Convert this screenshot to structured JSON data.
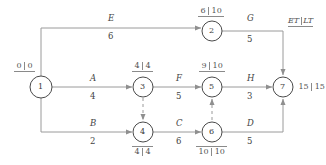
{
  "diagram": {
    "legend": {
      "et": "ET",
      "lt": "LT",
      "separator": "|"
    },
    "colors": {
      "line": "#9a9a9a",
      "node_stroke": "#4a4a4a",
      "text": "#3a3a3a",
      "rule": "#8a8a8a"
    },
    "nodes": [
      {
        "id": "1",
        "label": "1",
        "x": 41,
        "y": 87,
        "r": 11,
        "et": "0",
        "lt": "0",
        "times_pos": "above-left"
      },
      {
        "id": "2",
        "label": "2",
        "x": 212,
        "y": 31,
        "r": 10,
        "et": "6",
        "lt": "10",
        "times_pos": "above"
      },
      {
        "id": "3",
        "label": "3",
        "x": 143,
        "y": 87,
        "r": 10,
        "et": "4",
        "lt": "4",
        "times_pos": "above"
      },
      {
        "id": "4",
        "label": "4",
        "x": 143,
        "y": 132,
        "r": 10,
        "et": "4",
        "lt": "4",
        "times_pos": "below"
      },
      {
        "id": "5",
        "label": "5",
        "x": 212,
        "y": 87,
        "r": 10,
        "et": "9",
        "lt": "10",
        "times_pos": "above"
      },
      {
        "id": "6",
        "label": "6",
        "x": 212,
        "y": 132,
        "r": 10,
        "et": "10",
        "lt": "10",
        "times_pos": "below"
      },
      {
        "id": "7",
        "label": "7",
        "x": 283,
        "y": 87,
        "r": 10,
        "et": "15",
        "lt": "15",
        "times_pos": "right"
      }
    ],
    "activities": [
      {
        "name": "E",
        "duration": "6",
        "from": "1",
        "to": "2",
        "label_x": 110,
        "label_y": 20
      },
      {
        "name": "G",
        "duration": "5",
        "from": "2",
        "to": "7",
        "label_x": 248,
        "label_y": 20
      },
      {
        "name": "A",
        "duration": "4",
        "from": "1",
        "to": "3",
        "label_x": 92,
        "label_y": 76
      },
      {
        "name": "F",
        "duration": "5",
        "from": "3",
        "to": "5",
        "label_x": 178,
        "label_y": 76
      },
      {
        "name": "H",
        "duration": "3",
        "from": "5",
        "to": "7",
        "label_x": 248,
        "label_y": 76
      },
      {
        "name": "B",
        "duration": "2",
        "from": "1",
        "to": "4",
        "label_x": 92,
        "label_y": 121
      },
      {
        "name": "C",
        "duration": "6",
        "from": "4",
        "to": "6",
        "label_x": 178,
        "label_y": 121
      },
      {
        "name": "D",
        "duration": "5",
        "from": "6",
        "to": "7",
        "label_x": 249,
        "label_y": 121
      }
    ],
    "dummy_activities": [
      {
        "from": "3",
        "to": "4"
      },
      {
        "from": "6",
        "to": "5"
      }
    ]
  }
}
